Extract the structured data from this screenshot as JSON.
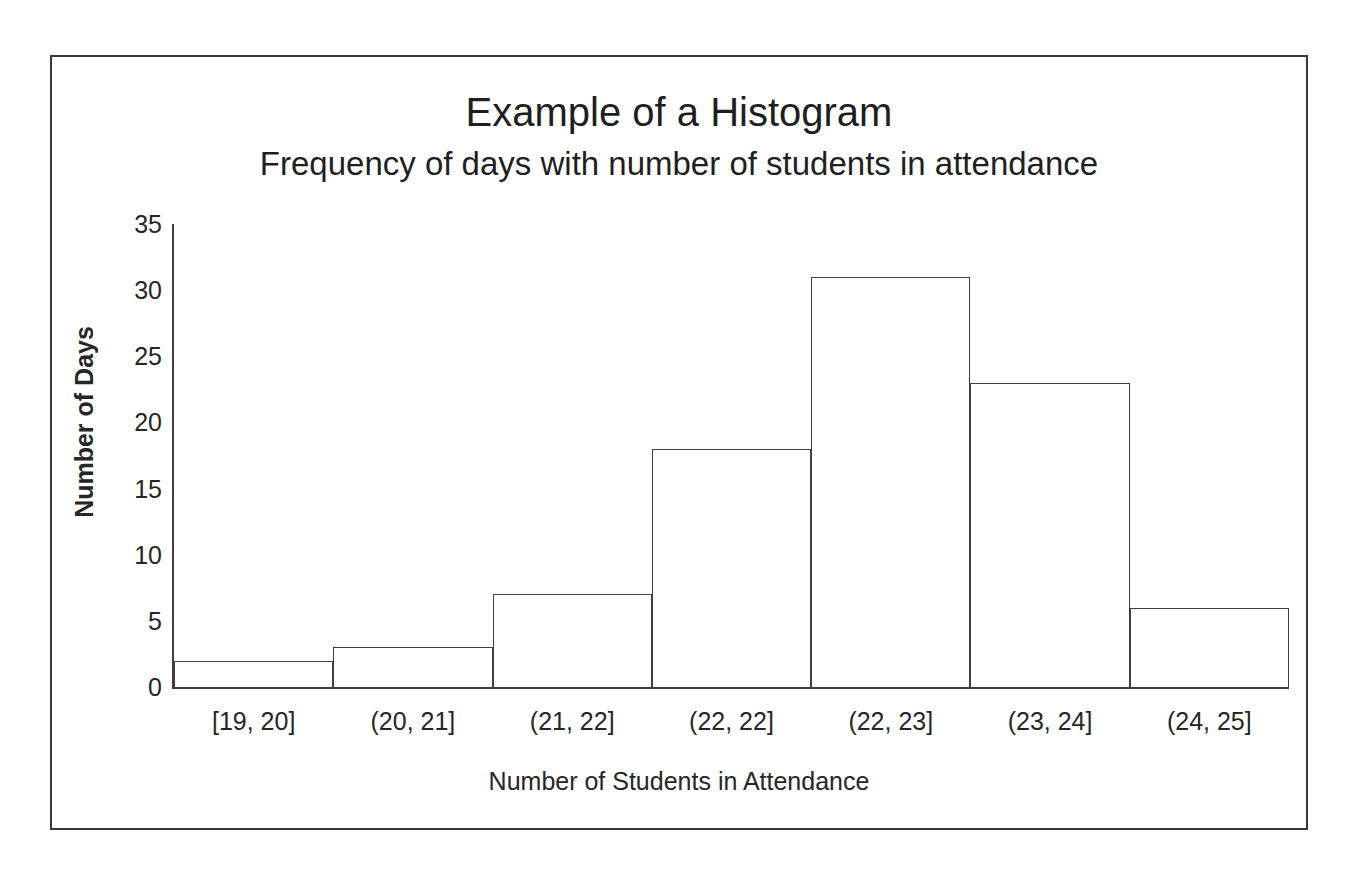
{
  "chart_data": {
    "type": "bar",
    "title": "Example of a Histogram",
    "subtitle": "Frequency of days with number of students in attendance",
    "xlabel": "Number of Students in Attendance",
    "ylabel": "Number of Days",
    "categories": [
      "[19, 20]",
      "(20, 21]",
      "(21, 22]",
      "(22, 22]",
      "(22, 23]",
      "(23, 24]",
      "(24, 25]"
    ],
    "values": [
      2,
      3,
      7,
      18,
      31,
      23,
      6
    ],
    "ylim": [
      0,
      35
    ],
    "yticks": [
      0,
      5,
      10,
      15,
      20,
      25,
      30,
      35
    ],
    "ytick_labels": [
      "0",
      "5",
      "10",
      "15",
      "20",
      "25",
      "30",
      "35"
    ],
    "grid": false,
    "legend": false,
    "bar_fill_color": "#ffffff",
    "bar_border_color": "#3f3f3f",
    "axis_color": "#404040",
    "text_color": "#262626",
    "frame_border_color": "#3a3a3a",
    "background_color": "#ffffff"
  }
}
